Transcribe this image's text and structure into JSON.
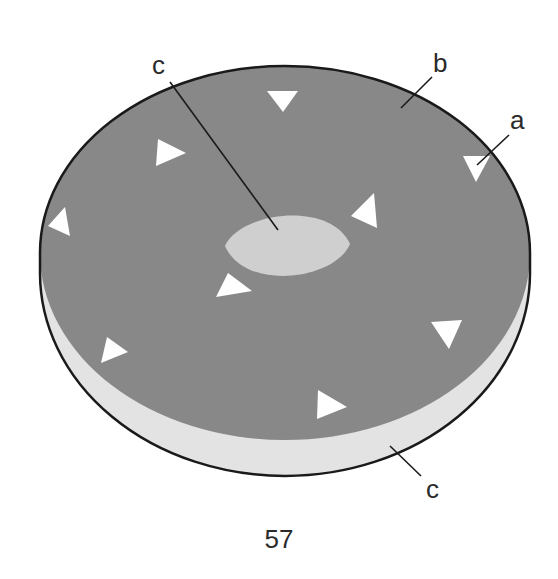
{
  "colors": {
    "top_face": "#888888",
    "side_band": "#e3e3e3",
    "center_ellipse": "#cfcfcf",
    "outline": "#1a1a1a",
    "triangles": "#ffffff",
    "text": "#2a2a2a"
  },
  "labels": {
    "a": "a",
    "b": "b",
    "c_top": "c",
    "c_bottom": "c"
  },
  "page_number": "57",
  "triangles": [
    {
      "name": "triangle-top-center",
      "points": "267,91 298,91 283,112"
    },
    {
      "name": "triangle-upper-left",
      "points": "158,139 186,153 156,166"
    },
    {
      "name": "triangle-upper-right",
      "points": "463,156 490,156 476,182"
    },
    {
      "name": "triangle-left",
      "points": "65,207 70,236 48,226"
    },
    {
      "name": "triangle-right-of-center",
      "points": "374,193 377,228 351,216"
    },
    {
      "name": "triangle-below-center",
      "points": "228,273 252,291 216,297"
    },
    {
      "name": "triangle-lower-left",
      "points": "107,337 128,352 101,363"
    },
    {
      "name": "triangle-lower-right",
      "points": "431,322 462,320 449,349"
    },
    {
      "name": "triangle-bottom",
      "points": "318,390 347,407 317,419"
    }
  ]
}
